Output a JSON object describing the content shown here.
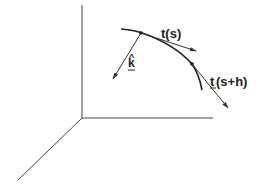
{
  "diagram": {
    "type": "3d-space-curve-tangent-vectors",
    "colors": {
      "line": "#333333",
      "background": "#ffffff"
    },
    "axes": {
      "origin": [
        82,
        118
      ],
      "vertical_end": [
        82,
        5
      ],
      "horizontal_end": [
        213,
        118
      ],
      "diagonal_end": [
        18,
        180
      ]
    },
    "curve": {
      "path": "M121,29 Q135,30 145,34 Q175,45 192,64 Q199,74 202,90"
    },
    "points": [
      {
        "name": "point-s",
        "xy": [
          141,
          33
        ]
      },
      {
        "name": "point-s-plus-h",
        "xy": [
          192,
          64
        ]
      }
    ],
    "vectors": [
      {
        "name": "tangent-s",
        "from": [
          141,
          33
        ],
        "to": [
          196,
          51
        ],
        "label": "t(s)",
        "label_xy": [
          161,
          38
        ]
      },
      {
        "name": "binormal-k",
        "from": [
          141,
          33
        ],
        "to": [
          113,
          79
        ],
        "label": "k",
        "hat": "^",
        "label_xy": [
          128,
          67
        ]
      },
      {
        "name": "tangent-s-plus-h",
        "from": [
          192,
          64
        ],
        "to": [
          228,
          108
        ],
        "label_first": "t",
        "label_rest": "(s+h)",
        "label_xy": [
          210,
          86
        ]
      }
    ],
    "labels": {
      "t_s": "t(s)",
      "k_hat_letter": "k",
      "k_hat_caret": "^",
      "t_sh_letter": "t",
      "t_sh_rest": "(s+h)"
    }
  }
}
